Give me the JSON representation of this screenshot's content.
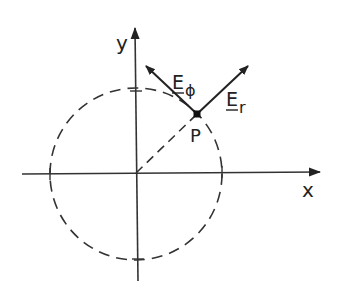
{
  "diagram": {
    "axes": {
      "x_label": "x",
      "y_label": "y"
    },
    "point": {
      "label": "P"
    },
    "vectors": [
      {
        "id": "E_r",
        "base": "E",
        "subscript": "r",
        "direction": "radial"
      },
      {
        "id": "E_phi",
        "base": "E",
        "subscript": "ϕ",
        "direction": "azimuthal"
      }
    ],
    "circle": {
      "style": "dashed"
    },
    "radius_line": {
      "style": "dashed"
    },
    "colors": {
      "ink": "#222222",
      "background": "#ffffff"
    }
  }
}
